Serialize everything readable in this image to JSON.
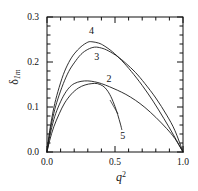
{
  "chart_data": {
    "type": "line",
    "title": "",
    "xlabel": "q2",
    "ylabel": "delta_1m",
    "xlim": [
      0.0,
      1.0
    ],
    "ylim": [
      0.0,
      0.3
    ],
    "grid": false,
    "legend_position": "inline-curve-labels",
    "x_ticks": [
      "0.0",
      "0.5",
      "1.0"
    ],
    "x_tick_values": [
      0.0,
      0.5,
      1.0
    ],
    "y_ticks": [
      "0.0",
      "0.1",
      "0.2",
      "0.3"
    ],
    "y_tick_values": [
      0.0,
      0.1,
      0.2,
      0.3
    ],
    "x_minor_tick_count": 4,
    "y_minor_tick_count": 4,
    "series": [
      {
        "name": "4",
        "label": "4",
        "peak_x": 0.33,
        "peak_y": 0.245,
        "x": [
          0.0,
          0.02,
          0.05,
          0.08,
          0.12,
          0.16,
          0.2,
          0.25,
          0.3,
          0.33,
          0.38,
          0.42,
          0.48,
          0.55,
          0.62,
          0.7,
          0.78,
          0.86,
          0.93,
          1.0
        ],
        "values": [
          0.0,
          0.048,
          0.098,
          0.134,
          0.172,
          0.199,
          0.218,
          0.234,
          0.244,
          0.245,
          0.242,
          0.236,
          0.223,
          0.203,
          0.179,
          0.148,
          0.113,
          0.074,
          0.038,
          0.0
        ]
      },
      {
        "name": "3",
        "label": "3",
        "peak_x": 0.35,
        "peak_y": 0.233,
        "x": [
          0.0,
          0.02,
          0.05,
          0.08,
          0.12,
          0.16,
          0.2,
          0.25,
          0.3,
          0.35,
          0.4,
          0.45,
          0.52,
          0.58,
          0.65,
          0.72,
          0.8,
          0.88,
          0.94,
          1.0
        ],
        "values": [
          0.0,
          0.042,
          0.086,
          0.118,
          0.152,
          0.179,
          0.198,
          0.217,
          0.228,
          0.233,
          0.231,
          0.225,
          0.212,
          0.197,
          0.177,
          0.152,
          0.12,
          0.082,
          0.048,
          0.0
        ]
      },
      {
        "name": "2",
        "label": "2",
        "peak_x": 0.3,
        "peak_y": 0.158,
        "x": [
          0.0,
          0.02,
          0.05,
          0.08,
          0.12,
          0.16,
          0.2,
          0.25,
          0.3,
          0.35,
          0.4,
          0.46,
          0.52,
          0.58,
          0.65,
          0.72,
          0.8,
          0.88,
          0.94,
          1.0
        ],
        "values": [
          0.0,
          0.035,
          0.072,
          0.098,
          0.124,
          0.142,
          0.152,
          0.157,
          0.158,
          0.156,
          0.152,
          0.145,
          0.137,
          0.128,
          0.115,
          0.099,
          0.077,
          0.052,
          0.03,
          0.0
        ]
      },
      {
        "name": "5",
        "label": "5",
        "peak_x": 0.37,
        "peak_y": 0.152,
        "x": [
          0.0,
          0.02,
          0.05,
          0.09,
          0.13,
          0.18,
          0.23,
          0.28,
          0.33,
          0.37,
          0.41,
          0.44,
          0.47,
          0.5,
          0.52,
          0.54,
          0.55
        ],
        "values": [
          0.0,
          0.026,
          0.056,
          0.085,
          0.109,
          0.129,
          0.142,
          0.149,
          0.152,
          0.152,
          0.147,
          0.138,
          0.123,
          0.101,
          0.083,
          0.062,
          0.05
        ]
      }
    ],
    "curve_labels": [
      {
        "text": "4",
        "x": 0.33,
        "y": 0.268
      },
      {
        "text": "3",
        "x": 0.37,
        "y": 0.211
      },
      {
        "text": "2",
        "x": 0.46,
        "y": 0.163
      },
      {
        "text": "5",
        "x": 0.56,
        "y": 0.035
      }
    ],
    "colors": {
      "axis": "#111111",
      "curve": "#1a1a1a",
      "background": "#ffffff"
    }
  }
}
